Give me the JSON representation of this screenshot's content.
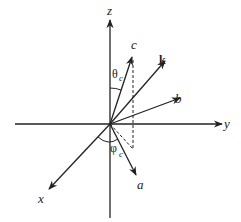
{
  "diagram": {
    "type": "3d-coordinate-axes",
    "axes": {
      "z_label": "z",
      "y_label": "y",
      "x_label": "x"
    },
    "vectors": {
      "a_label": "a",
      "b_label": "b",
      "c_label": "c",
      "k_label": "k"
    },
    "angles": {
      "theta_symbol": "θ",
      "theta_sub": "c",
      "phi_symbol": "φ",
      "phi_sub": "c"
    },
    "colors": {
      "line": "#222222",
      "background": "#ffffff"
    }
  }
}
